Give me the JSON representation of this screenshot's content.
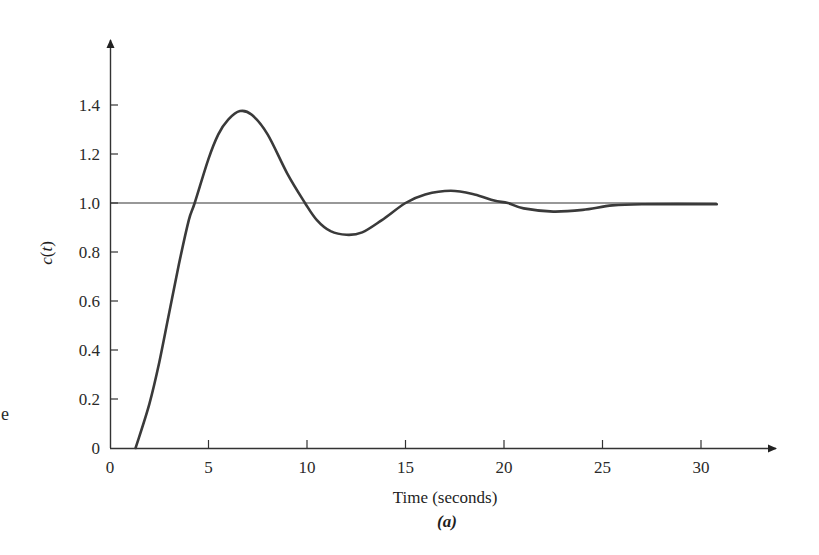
{
  "figure": {
    "caption": "(a)",
    "stray_text": "e"
  },
  "chart_data": {
    "type": "line",
    "title": "",
    "xlabel": "Time (seconds)",
    "ylabel": "c(t)",
    "xlim": [
      0,
      32
    ],
    "ylim": [
      0,
      1.6
    ],
    "x_ticks": [
      0,
      5,
      10,
      15,
      20,
      25,
      30
    ],
    "x_tick_labels": [
      "0",
      "5",
      "10",
      "15",
      "20",
      "25",
      "30"
    ],
    "y_ticks": [
      0,
      0.2,
      0.4,
      0.6,
      0.8,
      1.0,
      1.2,
      1.4
    ],
    "y_tick_labels": [
      "0",
      "0.2",
      "0.4",
      "0.6",
      "0.8",
      "1.0",
      "1.2",
      "1.4"
    ],
    "grid": false,
    "legend": null,
    "reference_line": {
      "y": 1.0,
      "label": "final value"
    },
    "series": [
      {
        "name": "c(t) step response",
        "x": [
          0,
          1.3,
          2.0,
          2.5,
          3.0,
          3.5,
          4.0,
          4.3,
          5.0,
          5.5,
          6.0,
          6.6,
          7.2,
          8.0,
          9.0,
          9.9,
          10.5,
          11.2,
          12.0,
          12.8,
          13.8,
          15.0,
          16.0,
          17.3,
          18.5,
          19.5,
          20.2,
          21.0,
          22.5,
          24.0,
          25.5,
          27.0,
          30.8
        ],
        "y": [
          0,
          0,
          0.18,
          0.35,
          0.55,
          0.75,
          0.93,
          1.0,
          1.18,
          1.28,
          1.34,
          1.375,
          1.36,
          1.28,
          1.12,
          1.0,
          0.93,
          0.885,
          0.87,
          0.88,
          0.93,
          1.0,
          1.035,
          1.05,
          1.035,
          1.01,
          1.0,
          0.978,
          0.965,
          0.972,
          0.99,
          0.995,
          0.995
        ]
      }
    ]
  }
}
